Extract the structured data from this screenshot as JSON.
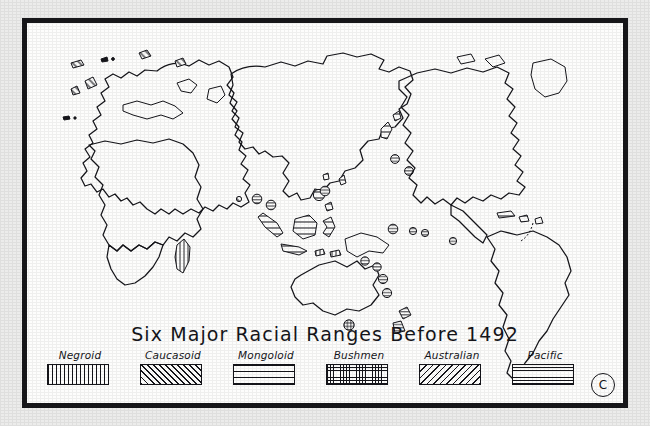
{
  "map": {
    "title": "Six Major Racial Ranges Before 1492",
    "copyright_mark": "C",
    "projection_note": "world map, Africa-Eurasia left, Americas right"
  },
  "legend": {
    "entries": [
      {
        "label": "Negroid",
        "pattern": "vertical-lines",
        "regions": "Sub-Saharan Africa, New Guinea, Melanesia"
      },
      {
        "label": "Caucasoid",
        "pattern": "diagonal-forward",
        "regions": "Europe, North Africa, Middle East, India"
      },
      {
        "label": "Mongoloid",
        "pattern": "horizontal-wide",
        "regions": "North and East Asia, the Americas"
      },
      {
        "label": "Bushmen",
        "pattern": "cross-hatch-dense",
        "regions": "Southern Africa, Tasmania"
      },
      {
        "label": "Australian",
        "pattern": "diagonal-back",
        "regions": "Australia"
      },
      {
        "label": "Pacific",
        "pattern": "horizontal-tight",
        "regions": "Pacific island groups, Polynesia"
      }
    ]
  },
  "colors": {
    "ink": "#15151a",
    "paper": "#fdfdfc",
    "mount": "#ececeb"
  }
}
